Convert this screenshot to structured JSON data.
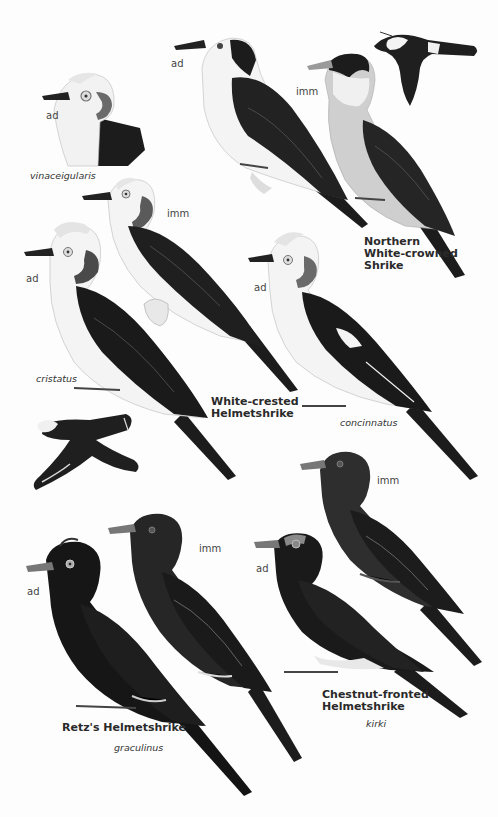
{
  "plate": {
    "colors": {
      "background": "#fdfdfd",
      "plumage_black": "#1a1a1a",
      "plumage_dark": "#2b2b2b",
      "white": "#f4f4f4",
      "grey_breast": "#cfcfcf",
      "label_text": "#3a3a3a"
    },
    "species": [
      {
        "common_name": [
          "Northern",
          "White-crowned",
          "Shrike"
        ],
        "figures": [
          {
            "age": "ad"
          },
          {
            "age": "imm"
          },
          {
            "pose": "flight"
          }
        ]
      },
      {
        "common_name": [
          "White-crested",
          "Helmetshrike"
        ],
        "subspecies": [
          {
            "name": "vinaceigularis",
            "age": "ad"
          },
          {
            "name": "cristatus",
            "age": "ad"
          },
          {
            "name": "concinnatus",
            "age": "ad"
          }
        ],
        "figures": [
          {
            "age": "imm"
          },
          {
            "pose": "flight"
          }
        ]
      },
      {
        "common_name": [
          "Retz's Helmetshrike"
        ],
        "subspecies": [
          {
            "name": "graculinus"
          }
        ],
        "figures": [
          {
            "age": "ad"
          },
          {
            "age": "imm"
          }
        ]
      },
      {
        "common_name": [
          "Chestnut-fronted",
          "Helmetshrike"
        ],
        "subspecies": [
          {
            "name": "kirki"
          }
        ],
        "figures": [
          {
            "age": "ad"
          },
          {
            "age": "imm"
          }
        ]
      }
    ]
  },
  "labels": {
    "vinaceigularis_age": "ad",
    "vinaceigularis": "vinaceigularis",
    "nwcs_ad_age": "ad",
    "nwcs_imm_age": "imm",
    "nwcs_name_1": "Northern",
    "nwcs_name_2": "White-crowned",
    "nwcs_name_3": "Shrike",
    "wch_imm_age": "imm",
    "cristatus_age": "ad",
    "cristatus": "cristatus",
    "wch_name_1": "White-crested",
    "wch_name_2": "Helmetshrike",
    "concinnatus_age": "ad",
    "concinnatus": "concinnatus",
    "retz_ad_age": "ad",
    "retz_imm_age": "imm",
    "retz_name": "Retz's Helmetshrike",
    "graculinus": "graculinus",
    "cfh_imm_age": "imm",
    "cfh_ad_age": "ad",
    "cfh_name_1": "Chestnut-fronted",
    "cfh_name_2": "Helmetshrike",
    "kirki": "kirki"
  }
}
